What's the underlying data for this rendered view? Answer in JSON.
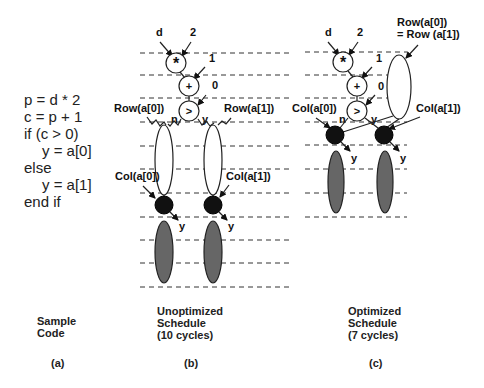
{
  "code": {
    "lines": [
      "p = d * 2",
      "c = p + 1",
      "if (c > 0)",
      "y = a[0]",
      "else",
      "y = a[1]",
      "end if"
    ],
    "caption_line1": "Sample",
    "caption_line2": "Code",
    "panel_label": "(a)"
  },
  "unoptimized": {
    "inputs": {
      "d": "d",
      "two": "2",
      "one": "1",
      "zero": "0"
    },
    "ops": {
      "mul": "*",
      "add": "+",
      "cmp": ">"
    },
    "branch": {
      "n": "n",
      "y": "y"
    },
    "row0": "Row(a[0])",
    "row1": "Row(a[1])",
    "col0": "Col(a[0])",
    "col1": "Col(a[1])",
    "out0": "y",
    "out1": "y",
    "caption_line1": "Unoptimized",
    "caption_line2": "Schedule",
    "caption_line3": "(10 cycles)",
    "panel_label": "(b)",
    "cycles": 10
  },
  "optimized": {
    "inputs": {
      "d": "d",
      "two": "2",
      "one": "1",
      "zero": "0"
    },
    "ops": {
      "mul": "*",
      "add": "+",
      "cmp": ">"
    },
    "branch": {
      "n": "n",
      "y": "y"
    },
    "row_shared_line1": "Row(a[0])",
    "row_shared_line2": "= Row (a[1])",
    "col0": "Col(a[0])",
    "col1": "Col(a[1])",
    "out0": "y",
    "out1": "y",
    "caption_line1": "Optimized",
    "caption_line2": "Schedule",
    "caption_line3": "(7 cycles)",
    "panel_label": "(c)",
    "cycles": 7
  }
}
